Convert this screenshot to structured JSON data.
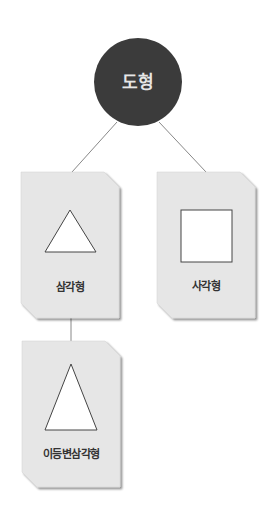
{
  "diagram": {
    "type": "tree",
    "colors": {
      "root_fill": "#3b3b3b",
      "root_text": "#e8e8e8",
      "card_fill": "#e6e6e6",
      "card_shadow": "#9a9a9a",
      "shape_fill": "#ffffff",
      "shape_stroke": "#444444",
      "connector": "#888888"
    },
    "root": {
      "label": "도형"
    },
    "nodes": [
      {
        "id": "triangle",
        "label": "삼각형",
        "shape": "triangle",
        "parent": "root"
      },
      {
        "id": "square",
        "label": "사각형",
        "shape": "square",
        "parent": "root"
      },
      {
        "id": "isosceles",
        "label": "이등변삼각형",
        "shape": "isosceles-triangle",
        "parent": "triangle"
      }
    ]
  }
}
